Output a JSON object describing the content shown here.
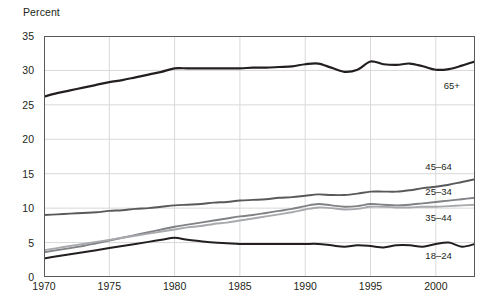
{
  "chart_data": {
    "type": "line",
    "title": "",
    "subtitle": "",
    "ylabel": "Percent",
    "xlabel": "",
    "ylim": [
      0,
      35
    ],
    "xlim": [
      1970,
      2003
    ],
    "ytick_labels": [
      "0",
      "5",
      "10",
      "15",
      "20",
      "25",
      "30",
      "35"
    ],
    "ytick_values": [
      0,
      5,
      10,
      15,
      20,
      25,
      30,
      35
    ],
    "xtick_labels": [
      "1970",
      "1975",
      "1980",
      "1985",
      "1990",
      "1995",
      "2000"
    ],
    "xtick_values": [
      1970,
      1975,
      1980,
      1985,
      1990,
      1995,
      2000
    ],
    "grid": "horizontal-and-vertical",
    "legend_position": "right-inline-labels",
    "x": [
      1970,
      1971,
      1972,
      1973,
      1974,
      1975,
      1976,
      1977,
      1978,
      1979,
      1980,
      1981,
      1982,
      1983,
      1984,
      1985,
      1986,
      1987,
      1988,
      1989,
      1990,
      1991,
      1992,
      1993,
      1994,
      1995,
      1996,
      1997,
      1998,
      1999,
      2000,
      2001,
      2002,
      2003
    ],
    "series": [
      {
        "name": "65+",
        "label": "65+",
        "color": "#231f20",
        "width": 2.2,
        "values": [
          26.2,
          26.7,
          27.1,
          27.5,
          27.9,
          28.3,
          28.6,
          29.0,
          29.4,
          29.8,
          30.3,
          30.3,
          30.3,
          30.3,
          30.3,
          30.3,
          30.4,
          30.4,
          30.5,
          30.6,
          30.9,
          31.0,
          30.4,
          29.8,
          30.1,
          31.3,
          30.9,
          30.8,
          31.0,
          30.6,
          30.1,
          30.2,
          30.7,
          31.3
        ]
      },
      {
        "name": "45-64",
        "label": "45–64",
        "color": "#58595b",
        "width": 1.9,
        "values": [
          9.0,
          9.1,
          9.2,
          9.3,
          9.4,
          9.6,
          9.7,
          9.9,
          10.0,
          10.2,
          10.4,
          10.5,
          10.6,
          10.8,
          10.9,
          11.1,
          11.2,
          11.3,
          11.5,
          11.6,
          11.8,
          12.0,
          11.9,
          11.9,
          12.1,
          12.4,
          12.4,
          12.4,
          12.6,
          12.9,
          13.1,
          13.4,
          13.8,
          14.2
        ]
      },
      {
        "name": "25-34",
        "label": "25–34",
        "color": "#808285",
        "width": 1.9,
        "values": [
          3.6,
          3.9,
          4.2,
          4.5,
          4.9,
          5.3,
          5.7,
          6.1,
          6.5,
          6.9,
          7.3,
          7.6,
          7.9,
          8.2,
          8.5,
          8.8,
          9.0,
          9.3,
          9.6,
          9.9,
          10.3,
          10.6,
          10.4,
          10.2,
          10.3,
          10.6,
          10.5,
          10.4,
          10.5,
          10.7,
          10.9,
          11.1,
          11.3,
          11.5
        ]
      },
      {
        "name": "35-44",
        "label": "35–44",
        "color": "#a7a9ac",
        "width": 1.9,
        "values": [
          3.9,
          4.2,
          4.5,
          4.8,
          5.1,
          5.4,
          5.7,
          6.0,
          6.3,
          6.6,
          6.9,
          7.2,
          7.4,
          7.7,
          7.9,
          8.2,
          8.5,
          8.8,
          9.1,
          9.4,
          9.8,
          10.1,
          10.0,
          9.8,
          9.9,
          10.2,
          10.2,
          10.1,
          10.1,
          10.2,
          10.2,
          10.3,
          10.4,
          10.5
        ]
      },
      {
        "name": "18-24",
        "label": "18–24",
        "color": "#231f20",
        "width": 2.0,
        "values": [
          2.7,
          3.0,
          3.3,
          3.6,
          3.9,
          4.2,
          4.5,
          4.8,
          5.1,
          5.4,
          5.7,
          5.4,
          5.2,
          5.0,
          4.9,
          4.8,
          4.8,
          4.8,
          4.8,
          4.8,
          4.8,
          4.8,
          4.6,
          4.4,
          4.6,
          4.5,
          4.3,
          4.6,
          4.6,
          4.4,
          4.8,
          5.0,
          4.4,
          4.8
        ]
      }
    ],
    "series_label_positions": [
      {
        "label": "65+",
        "x": 2000.6,
        "y": 27.7
      },
      {
        "label": "45–64",
        "x": 1999.2,
        "y": 16.0
      },
      {
        "label": "25–34",
        "x": 1999.2,
        "y": 12.4
      },
      {
        "label": "35–44",
        "x": 1999.2,
        "y": 8.6
      },
      {
        "label": "18–24",
        "x": 1999.2,
        "y": 3.0
      }
    ]
  }
}
